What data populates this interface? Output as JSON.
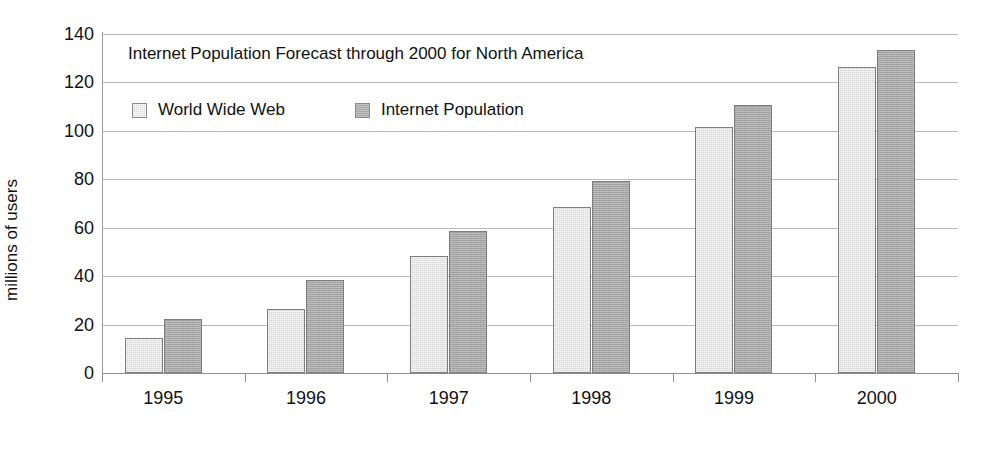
{
  "chart_data": {
    "type": "bar",
    "title": "Internet Population Forecast through 2000 for North America",
    "xlabel": "",
    "ylabel": "millions of users",
    "categories": [
      "1995",
      "1996",
      "1997",
      "1998",
      "1999",
      "2000"
    ],
    "series": [
      {
        "name": "World Wide Web",
        "color": "#d7d7d7",
        "values": [
          14.5,
          26.5,
          48.5,
          68.5,
          101.5,
          126.5
        ]
      },
      {
        "name": "Internet Population",
        "color": "#a3a3a3",
        "values": [
          22.5,
          38.5,
          58.5,
          79.5,
          110.5,
          133.5
        ]
      }
    ],
    "ylim": [
      0,
      140
    ],
    "ytick_step": 20,
    "yticks": [
      "0",
      "20",
      "40",
      "60",
      "80",
      "100",
      "120",
      "140"
    ],
    "grid": true,
    "legend_position": "inside-top-left",
    "title_position": "inside-top-left",
    "axis_color": "#8d8d8d",
    "grid_color": "#b9b9b9",
    "background": "#ffffff"
  }
}
